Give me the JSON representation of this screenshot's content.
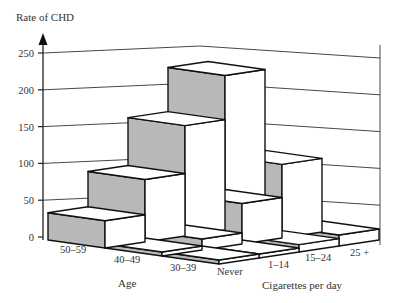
{
  "chart_data": {
    "type": "bar",
    "subtype": "3d-bar",
    "title": "",
    "ylabel": "Rate of CHD",
    "xlabel": "Age",
    "zlabel": "Cigarettes per day",
    "ylim": [
      0,
      250
    ],
    "yticks": [
      "0",
      "50",
      "100",
      "150",
      "200",
      "250"
    ],
    "categories": [
      "50–59",
      "40–49",
      "30–39"
    ],
    "depth_categories": [
      "Never",
      "1–14",
      "15–24",
      "25 +"
    ],
    "series": [
      {
        "name": "Never",
        "values": [
          37,
          5,
          2
        ]
      },
      {
        "name": "1–14",
        "values": [
          85,
          15,
          5
        ]
      },
      {
        "name": "15–24",
        "values": [
          150,
          55,
          10
        ]
      },
      {
        "name": "25 +",
        "values": [
          210,
          100,
          15
        ]
      }
    ],
    "grid": true,
    "legend": "none"
  },
  "labels": {
    "ylabel": "Rate of CHD",
    "age_title": "Age",
    "cig_title": "Cigarettes per day",
    "age": [
      "50–59",
      "40–49",
      "30–39"
    ],
    "cig": [
      "Never",
      "1–14",
      "15–24",
      "25 +"
    ],
    "yticks": [
      "0",
      "50",
      "100",
      "150",
      "200",
      "250"
    ]
  }
}
